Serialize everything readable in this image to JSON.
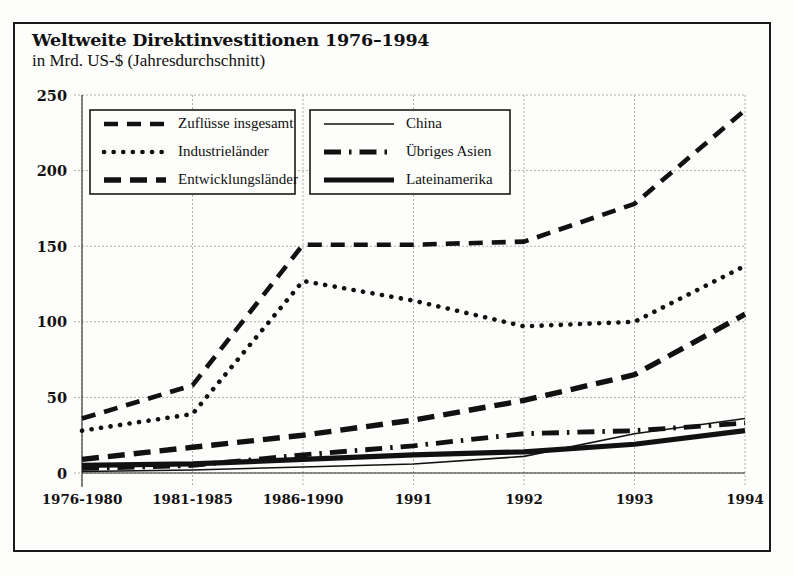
{
  "chart_data": {
    "type": "line",
    "title": "Weltweite Direktinvestitionen 1976–1994",
    "subtitle": "in Mrd. US-$ (Jahresdurchschnitt)",
    "xlabel": "",
    "ylabel": "",
    "ylim": [
      0,
      250
    ],
    "yticks": [
      0,
      50,
      100,
      150,
      200,
      250
    ],
    "grid": true,
    "legend_position": "inside-top-left",
    "categories": [
      "1976-1980",
      "1981-1985",
      "1986-1990",
      "1991",
      "1992",
      "1993",
      "1994"
    ],
    "series": [
      {
        "name": "Zuflüsse insgesamt",
        "style": "dashed",
        "values": [
          36,
          58,
          151,
          151,
          153,
          178,
          240
        ]
      },
      {
        "name": "Industrieländer",
        "style": "dotted",
        "values": [
          28,
          39,
          127,
          114,
          97,
          100,
          137
        ]
      },
      {
        "name": "Entwicklungsländer",
        "style": "dashed-thick",
        "values": [
          9,
          17,
          25,
          35,
          48,
          65,
          105
        ]
      },
      {
        "name": "China",
        "style": "thin-solid",
        "values": [
          1,
          2,
          4,
          6,
          11,
          26,
          36
        ]
      },
      {
        "name": "Übriges Asien",
        "style": "dash-dot",
        "values": [
          3,
          5,
          12,
          18,
          26,
          28,
          33
        ]
      },
      {
        "name": "Lateinamerika",
        "style": "thick-solid",
        "values": [
          5,
          6,
          9,
          12,
          14,
          19,
          28
        ]
      }
    ]
  },
  "axis": {
    "yticks": [
      "0",
      "50",
      "100",
      "150",
      "200",
      "250"
    ],
    "xticks": [
      "1976-1980",
      "1981-1985",
      "1986-1990",
      "1991",
      "1992",
      "1993",
      "1994"
    ]
  },
  "legend": {
    "left_box": [
      {
        "label": "Zuflüsse insgesamt",
        "style": "dashed"
      },
      {
        "label": "Industrieländer",
        "style": "dotted"
      },
      {
        "label": "Entwicklungsländer",
        "style": "dashed-thick"
      }
    ],
    "right_box": [
      {
        "label": "China",
        "style": "thin-solid"
      },
      {
        "label": "Übriges Asien",
        "style": "dash-dot"
      },
      {
        "label": "Lateinamerika",
        "style": "thick-solid"
      }
    ]
  },
  "colors": {
    "ink": "#111111",
    "grid": "#9a9a9a",
    "background": "#fdfdfb",
    "frame": "#1a1a1a"
  }
}
